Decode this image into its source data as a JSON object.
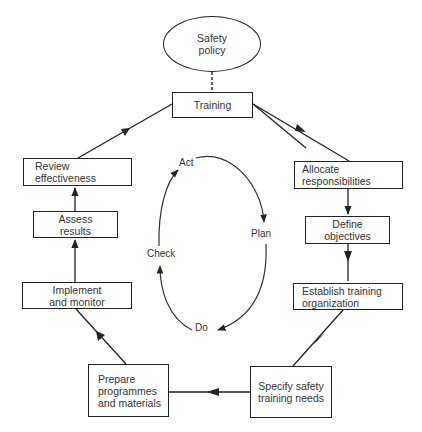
{
  "diagram": {
    "root": {
      "line1": "Safety",
      "line2": "policy"
    },
    "nodes": {
      "training": {
        "line1": "Training"
      },
      "allocate": {
        "line1": "Allocate",
        "line2": "responsibilities"
      },
      "define": {
        "line1": "Define",
        "line2": "objectives"
      },
      "establish": {
        "line1": "Establish training",
        "line2": "organization"
      },
      "specify": {
        "line1": "Specify safety",
        "line2": "training needs"
      },
      "prepare": {
        "line1": "Prepare",
        "line2": "programmes",
        "line3": "and materials"
      },
      "implement": {
        "line1": "Implement",
        "line2": "and monitor"
      },
      "assess": {
        "line1": "Assess",
        "line2": "results"
      },
      "review": {
        "line1": "Review",
        "line2": "effectiveness"
      }
    },
    "flow_order": [
      "Training",
      "Allocate responsibilities",
      "Define objectives",
      "Establish training organization",
      "Specify safety training needs",
      "Prepare programmes and materials",
      "Implement and monitor",
      "Assess results",
      "Review effectiveness",
      "Training"
    ],
    "cycle": {
      "act": "Act",
      "plan": "Plan",
      "do": "Do",
      "check": "Check",
      "direction": "clockwise: Act → Plan → Do → Check → Act"
    },
    "colors": {
      "stroke": "#222222",
      "text": "#333333",
      "background": "#ffffff"
    }
  }
}
